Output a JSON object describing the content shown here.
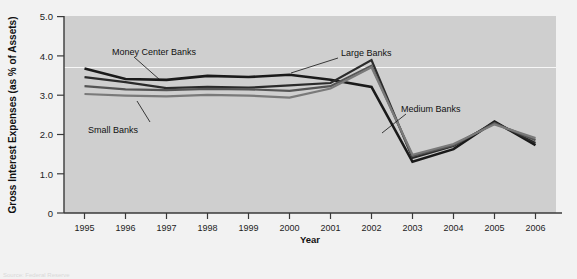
{
  "figure": {
    "background_color": "#f2f2f2",
    "plot_background_color": "#cfcfcf",
    "source_note": "Source: Federal Reserve"
  },
  "annotations": {
    "money_center": "Money Center Banks",
    "small": "Small Banks",
    "large": "Large Banks",
    "medium": "Medium Banks"
  },
  "chart_data": {
    "type": "line",
    "title": "",
    "subtitle": "",
    "xlabel": "Year",
    "ylabel": "Gross Interest Expenses (as % of Assets)",
    "categories": [
      "1995",
      "1996",
      "1997",
      "1998",
      "1999",
      "2000",
      "2001",
      "2002",
      "2003",
      "2004",
      "2005",
      "2006"
    ],
    "x": [
      1995,
      1996,
      1997,
      1998,
      1999,
      2000,
      2001,
      2002,
      2003,
      2004,
      2005,
      2006
    ],
    "xlim": [
      1994.5,
      2006.5
    ],
    "ylim": [
      0,
      5.0
    ],
    "yticks": [
      0,
      1.0,
      2.0,
      3.0,
      4.0,
      5.0
    ],
    "ytick_labels": [
      "0",
      "1.0",
      "2.0",
      "3.0",
      "4.0",
      "5.0"
    ],
    "xticks": [
      1995,
      1996,
      1997,
      1998,
      1999,
      2000,
      2001,
      2002,
      2003,
      2004,
      2005,
      2006
    ],
    "grid": false,
    "white_reference_line_y": 4.2,
    "legend": "inline-annotations",
    "legend_position": "inline",
    "series": [
      {
        "name": "Money Center Banks",
        "color": "#1a1a1a",
        "width": 2.6,
        "values": [
          3.67,
          3.4,
          3.38,
          3.48,
          3.45,
          3.51,
          3.38,
          3.2,
          2.85,
          3.15,
          3.12,
          2.6
        ]
      },
      {
        "name": "Large Banks",
        "color": "#2b2b2b",
        "width": 2.2,
        "values": [
          3.45,
          3.32,
          3.17,
          3.2,
          3.18,
          3.24,
          3.3,
          3.88,
          2.1,
          1.4,
          1.45,
          1.62
        ]
      },
      {
        "name": "Medium Banks",
        "color": "#555555",
        "width": 2.2,
        "values": [
          3.22,
          3.14,
          3.12,
          3.15,
          3.14,
          3.1,
          3.22,
          3.74,
          2.55,
          1.95,
          1.38,
          1.55
        ]
      },
      {
        "name": "Small Banks",
        "color": "#7a7a7a",
        "width": 2.2,
        "values": [
          3.02,
          2.98,
          2.96,
          3.0,
          2.98,
          2.93,
          3.16,
          3.7,
          2.62,
          2.05,
          1.35,
          1.52
        ]
      }
    ],
    "series_tail": {
      "note": "All four series converge 2003-2006",
      "x_tail": [
        2003,
        2004,
        2005,
        2006
      ],
      "values": {
        "Money Center Banks": [
          1.3,
          1.62,
          2.32,
          1.72
        ],
        "Large Banks": [
          1.4,
          1.7,
          2.3,
          1.78
        ],
        "Medium Banks": [
          1.45,
          1.72,
          2.28,
          1.85
        ],
        "Small Banks": [
          1.48,
          1.75,
          2.25,
          1.9
        ]
      }
    }
  }
}
